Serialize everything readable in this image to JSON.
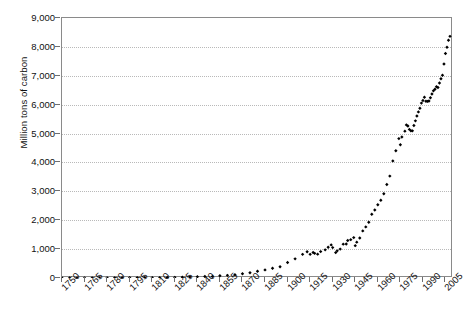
{
  "chart_data": {
    "type": "scatter",
    "title": "",
    "subtitle": "",
    "xlabel": "",
    "ylabel": "Million tons of carbon",
    "xlim": [
      1750,
      2010
    ],
    "ylim": [
      0,
      9000
    ],
    "grid": true,
    "legend": null,
    "marker": "filled-diamond",
    "marker_color": "#000000",
    "ytick_labels": [
      "9,000",
      "8,000",
      "7,000",
      "6,000",
      "5,000",
      "4,000",
      "3,000",
      "2,000",
      "1,000",
      "0"
    ],
    "ytick_values": [
      9000,
      8000,
      7000,
      6000,
      5000,
      4000,
      3000,
      2000,
      1000,
      0
    ],
    "xtick_labels": [
      "1750",
      "1765",
      "1780",
      "1795",
      "1810",
      "1825",
      "1840",
      "1855",
      "1870",
      "1885",
      "1900",
      "1915",
      "1930",
      "1945",
      "1960",
      "1975",
      "1990",
      "2005"
    ],
    "xtick_values": [
      1750,
      1765,
      1780,
      1795,
      1810,
      1825,
      1840,
      1855,
      1870,
      1885,
      1900,
      1915,
      1930,
      1945,
      1960,
      1975,
      1990,
      2005
    ],
    "x": [
      1750,
      1755,
      1760,
      1765,
      1770,
      1775,
      1780,
      1785,
      1790,
      1795,
      1800,
      1805,
      1810,
      1815,
      1820,
      1825,
      1830,
      1835,
      1840,
      1845,
      1850,
      1855,
      1860,
      1865,
      1870,
      1875,
      1880,
      1885,
      1890,
      1895,
      1900,
      1905,
      1910,
      1913,
      1915,
      1917,
      1918,
      1920,
      1922,
      1925,
      1927,
      1929,
      1930,
      1932,
      1933,
      1935,
      1937,
      1939,
      1940,
      1942,
      1944,
      1945,
      1946,
      1948,
      1950,
      1952,
      1954,
      1956,
      1958,
      1960,
      1962,
      1964,
      1966,
      1968,
      1970,
      1972,
      1974,
      1975,
      1976,
      1978,
      1979,
      1980,
      1981,
      1982,
      1983,
      1984,
      1985,
      1986,
      1987,
      1988,
      1989,
      1990,
      1991,
      1992,
      1993,
      1994,
      1995,
      1996,
      1997,
      1998,
      1999,
      2000,
      2001,
      2002,
      2003,
      2004,
      2005,
      2006,
      2007,
      2008
    ],
    "y": [
      3,
      3,
      3,
      3,
      4,
      4,
      5,
      6,
      7,
      8,
      8,
      9,
      10,
      12,
      17,
      23,
      28,
      34,
      42,
      52,
      54,
      78,
      92,
      114,
      147,
      183,
      236,
      280,
      338,
      391,
      534,
      663,
      819,
      907,
      819,
      885,
      854,
      825,
      913,
      975,
      1066,
      1145,
      1053,
      879,
      940,
      1001,
      1171,
      1178,
      1299,
      1327,
      1398,
      1120,
      1241,
      1383,
      1630,
      1768,
      1928,
      2208,
      2355,
      2535,
      2690,
      2914,
      3237,
      3527,
      4053,
      4407,
      4826,
      4615,
      4883,
      5083,
      5300,
      5262,
      5143,
      5095,
      5094,
      5277,
      5439,
      5607,
      5750,
      5876,
      6054,
      6143,
      6258,
      6118,
      6113,
      6127,
      6239,
      6369,
      6481,
      6535,
      6620,
      6595,
      6750,
      6896,
      7020,
      7406,
      7770,
      7985,
      8230,
      8365,
      8749
    ],
    "y_scale_note": "values in million metric tons of carbon"
  },
  "axis": {
    "ylabel_text": "Million tons of carbon"
  },
  "caption": {
    "text": ""
  }
}
